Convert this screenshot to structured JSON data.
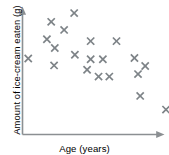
{
  "chart_data": {
    "type": "scatter",
    "title": "",
    "xlabel": "Age (years)",
    "ylabel": "Amount of ice-cream eaten (g)",
    "grid": false,
    "legend": null,
    "xlim": [
      0,
      100
    ],
    "ylim": [
      0,
      100
    ],
    "axis_ticks": {
      "x": [],
      "y": []
    },
    "marker_style": "x",
    "marker_color": "#7d8387",
    "axis_color": "#8b8f92",
    "point_count": 20,
    "series": [
      {
        "name": "ice-cream eaten vs age",
        "points": [
          {
            "x": 4.0,
            "y": 61.0
          },
          {
            "x": 17.0,
            "y": 76.5
          },
          {
            "x": 20.0,
            "y": 90.5
          },
          {
            "x": 29.0,
            "y": 84.0
          },
          {
            "x": 36.0,
            "y": 97.5
          },
          {
            "x": 22.5,
            "y": 69.5
          },
          {
            "x": 22.0,
            "y": 55.5
          },
          {
            "x": 36.5,
            "y": 64.0
          },
          {
            "x": 47.5,
            "y": 75.0
          },
          {
            "x": 47.5,
            "y": 60.5
          },
          {
            "x": 56.0,
            "y": 60.5
          },
          {
            "x": 53.0,
            "y": 46.5
          },
          {
            "x": 60.5,
            "y": 46.5
          },
          {
            "x": 65.5,
            "y": 75.0
          },
          {
            "x": 78.0,
            "y": 61.5
          },
          {
            "x": 85.5,
            "y": 55.0
          },
          {
            "x": 80.5,
            "y": 48.5
          },
          {
            "x": 82.0,
            "y": 31.0
          },
          {
            "x": 100.0,
            "y": 20.0
          },
          {
            "x": 45.0,
            "y": 52.0
          }
        ]
      }
    ]
  },
  "axes": {
    "x_axis_label": "Age (years)",
    "y_axis_label": "Amount of ice-cream eaten (g)"
  }
}
